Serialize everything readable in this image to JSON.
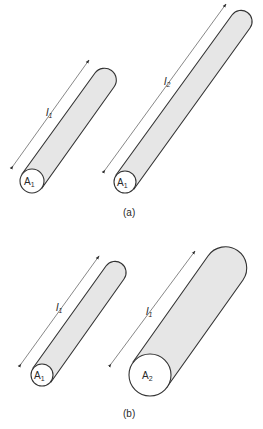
{
  "figure": {
    "panels": [
      {
        "id": "a",
        "caption": "(a)",
        "wires": [
          {
            "area_label": "A",
            "area_sub": "1",
            "length_label": "l",
            "length_sub": "1",
            "description": "short thin wire"
          },
          {
            "area_label": "A",
            "area_sub": "1",
            "length_label": "l",
            "length_sub": "2",
            "description": "long thin wire"
          }
        ]
      },
      {
        "id": "b",
        "caption": "(b)",
        "wires": [
          {
            "area_label": "A",
            "area_sub": "1",
            "length_label": "l",
            "length_sub": "1",
            "description": "thin wire"
          },
          {
            "area_label": "A",
            "area_sub": "2",
            "length_label": "l",
            "length_sub": "1",
            "description": "thick wire"
          }
        ]
      }
    ],
    "colors": {
      "fill": "#e6e6e6",
      "stroke": "#333333",
      "background": "#ffffff"
    }
  }
}
